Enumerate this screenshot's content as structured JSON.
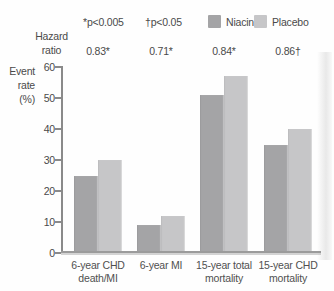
{
  "header": {
    "note_significance_1": "*p<0.005",
    "note_significance_2": "†p<0.05",
    "hazard_label_line1": "Hazard",
    "hazard_label_line2": "ratio"
  },
  "legend": {
    "items": [
      {
        "label": "Niacin",
        "color": "#a4a4a6"
      },
      {
        "label": "Placebo",
        "color": "#c6c6c8"
      }
    ]
  },
  "y_axis": {
    "label_lines": [
      "Event",
      "rate",
      "(%)"
    ],
    "ticks": [
      0,
      10,
      20,
      30,
      40,
      50,
      60
    ]
  },
  "chart_data": {
    "type": "bar",
    "title": "",
    "categories": [
      "6-year CHD death/MI",
      "6-year MI",
      "15-year total mortality",
      "15-year CHD mortality"
    ],
    "category_label_lines": [
      [
        "6-year CHD",
        "death/MI"
      ],
      [
        "6-year MI"
      ],
      [
        "15-year total",
        "mortality"
      ],
      [
        "15-year CHD",
        "mortality"
      ]
    ],
    "series": [
      {
        "name": "Niacin",
        "color": "#a4a4a6",
        "values": [
          25,
          9,
          51,
          35
        ]
      },
      {
        "name": "Placebo",
        "color": "#c6c6c8",
        "values": [
          30,
          12,
          57,
          40
        ]
      }
    ],
    "hazard_ratios": [
      "0.83*",
      "0.71*",
      "0.84*",
      "0.86†"
    ],
    "annotations": [
      "*p<0.005",
      "†p<0.05"
    ],
    "ylabel": "Event rate (%)",
    "xlabel": "",
    "ylim": [
      0,
      60
    ],
    "yticks": [
      0,
      10,
      20,
      30,
      40,
      50,
      60
    ],
    "grid": false,
    "legend_position": "top"
  },
  "colors": {
    "niacin": "#a4a4a6",
    "placebo": "#c6c6c8",
    "axis": "#8a8a8a",
    "baseline": "#9b9b9b",
    "text": "#4a4a4a"
  }
}
